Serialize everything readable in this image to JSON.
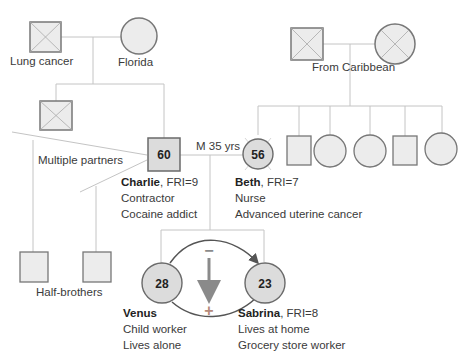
{
  "diagram": {
    "type": "genogram",
    "colors": {
      "line": "#c4c4c4",
      "shape_fill": "#ececec",
      "shape_border": "#777777",
      "highlight_fill": "#dcdcdc",
      "highlight_border": "#6a6a6a",
      "arrow": "#8a8a8a",
      "plus_minus": "#9a9a9a",
      "text": "#3a3a3a"
    },
    "paternal_grandfather": {
      "label": "Lung cancer",
      "deceased": true,
      "shape": "square"
    },
    "paternal_grandmother": {
      "label": "Florida",
      "deceased": false,
      "shape": "circle"
    },
    "paternal_uncle": {
      "deceased": true,
      "shape": "square"
    },
    "maternal_grandparents": {
      "label": "From Caribbean",
      "father_deceased": true,
      "mother_deceased": true
    },
    "maternal_siblings": [
      {
        "shape": "square"
      },
      {
        "shape": "circle"
      },
      {
        "shape": "circle"
      },
      {
        "shape": "square"
      },
      {
        "shape": "circle"
      }
    ],
    "partners_label": "Multiple partners",
    "half_brothers_label": "Half-brothers",
    "marriage_label": "M 35 yrs",
    "charlie": {
      "age": "60",
      "name": "Charlie",
      "fri": ", FRI=9",
      "line2": "Contractor",
      "line3": "Cocaine addict"
    },
    "beth": {
      "age": "56",
      "name": "Beth",
      "fri": ", FRI=7",
      "line2": "Nurse",
      "line3": "Advanced uterine cancer"
    },
    "venus": {
      "age": "28",
      "name": "Venus",
      "line2": "Child worker",
      "line3": "Lives alone"
    },
    "sabrina": {
      "age": "23",
      "name": "Sabrina",
      "fri": ", FRI=8",
      "line2": "Lives at home",
      "line3": "Grocery store worker"
    },
    "relationship_symbols": {
      "minus": "−",
      "plus": "+"
    }
  }
}
